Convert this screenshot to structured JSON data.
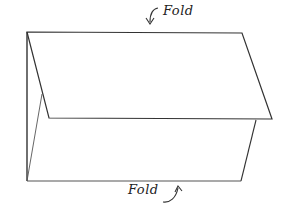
{
  "diagram": {
    "type": "fold-illustration",
    "labels": {
      "top_fold": "Fold",
      "bottom_fold": "Fold"
    },
    "colors": {
      "stroke": "#333333",
      "background": "#ffffff"
    },
    "shapes": {
      "top_flap": [
        [
          27,
          32
        ],
        [
          242,
          33
        ],
        [
          272,
          119
        ],
        [
          49,
          118
        ]
      ],
      "back_panel_left_edge": [
        [
          27,
          32
        ],
        [
          27,
          181
        ]
      ],
      "bottom_edge": [
        [
          27,
          181
        ],
        [
          241,
          181
        ]
      ],
      "right_lower_edge": [
        [
          256,
          120
        ],
        [
          241,
          181
        ]
      ],
      "inner_left_diagonal": [
        [
          27,
          181
        ],
        [
          42,
          94
        ]
      ]
    },
    "arrows": [
      {
        "name": "top-fold-arrow",
        "direction": "down",
        "near_label": "top_fold"
      },
      {
        "name": "bottom-fold-arrow",
        "direction": "up",
        "near_label": "bottom_fold"
      }
    ]
  }
}
